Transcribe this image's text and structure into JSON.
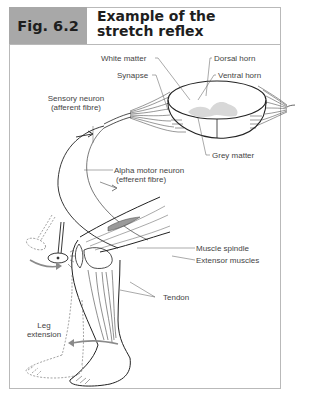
{
  "figure": {
    "number": "Fig. 6.2",
    "title_line1": "Example of the",
    "title_line2": "stretch reflex"
  },
  "labels": {
    "white_matter": "White matter",
    "dorsal_horn": "Dorsal horn",
    "synapse": "Synapse",
    "ventral_horn": "Ventral horn",
    "sensory_neuron_1": "Sensory neuron",
    "sensory_neuron_2": "(afferent fibre)",
    "alpha_motor_1": "Alpha motor neuron",
    "alpha_motor_2": "(efferent fibre)",
    "grey_matter": "Grey matter",
    "muscle_spindle": "Muscle spindle",
    "extensor_muscles": "Extensor muscles",
    "tendon": "Tendon",
    "leg_extension_1": "Leg",
    "leg_extension_2": "extension"
  },
  "colors": {
    "header_fill": "#a8a8a8",
    "border": "#b9b9b9",
    "grey_matter_fill": "#d8d8d8",
    "arrow": "#8a8a8a"
  }
}
